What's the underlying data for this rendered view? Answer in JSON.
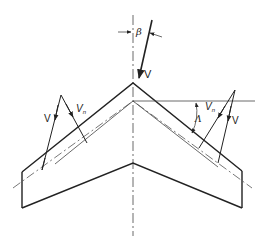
{
  "figure": {
    "colors": {
      "stroke": "#222222",
      "background": "#ffffff"
    }
  },
  "labels": {
    "beta": "β",
    "top_velocity": "V",
    "left_velocity": "V",
    "left_normal_velocity": "V",
    "left_normal_subscript": "n",
    "right_velocity": "V",
    "right_normal_velocity": "V",
    "right_normal_subscript": "n",
    "sweep": "Λ"
  }
}
